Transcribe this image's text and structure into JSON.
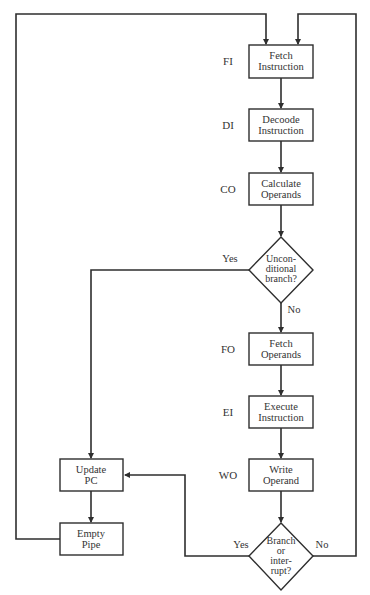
{
  "diagram": {
    "type": "flowchart",
    "colors": {
      "line": "#2e2e2e",
      "text": "#333333",
      "background": "#ffffff"
    },
    "stages": [
      {
        "id": "FI",
        "label": "FI",
        "line1": "Fetch",
        "line2": "Instruction"
      },
      {
        "id": "DI",
        "label": "DI",
        "line1": "Decoode",
        "line2": "Instruction"
      },
      {
        "id": "CO",
        "label": "CO",
        "line1": "Calculate",
        "line2": "Operands"
      },
      {
        "id": "FO",
        "label": "FO",
        "line1": "Fetch",
        "line2": "Operands"
      },
      {
        "id": "EI",
        "label": "EI",
        "line1": "Execute",
        "line2": "Instruction"
      },
      {
        "id": "WO",
        "label": "WO",
        "line1": "Write",
        "line2": "Operand"
      }
    ],
    "decisions": [
      {
        "id": "unconditional",
        "lines": [
          "Uncon-",
          "ditional",
          "branch?"
        ],
        "yes": "Yes",
        "no": "No"
      },
      {
        "id": "branch_interrupt",
        "lines": [
          "Branch",
          "or",
          "inter-",
          "rupt?"
        ],
        "yes": "Yes",
        "no": "No"
      }
    ],
    "side_boxes": [
      {
        "id": "update_pc",
        "line1": "Update",
        "line2": "PC"
      },
      {
        "id": "empty_pipe",
        "line1": "Empty",
        "line2": "Pipe"
      }
    ]
  }
}
